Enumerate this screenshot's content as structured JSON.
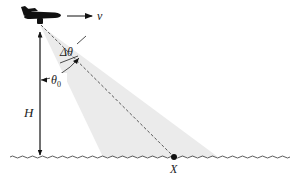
{
  "diagram": {
    "title": "",
    "labels": {
      "velocity": "v",
      "height": "H",
      "theta0": "θ",
      "theta0_sub": "0",
      "delta_theta": "Δθ",
      "target_point": "X"
    },
    "elements": [
      {
        "id": "airplane",
        "desc": "airplane silhouette moving right"
      },
      {
        "id": "velocity-arrow",
        "desc": "arrow pointing right labeled v"
      },
      {
        "id": "beam",
        "desc": "light-gray triangular beam from airplane to ground"
      },
      {
        "id": "line-of-sight",
        "desc": "dashed line from airplane to point X"
      },
      {
        "id": "height-arrow",
        "desc": "vertical arrow labeled H from airplane to ground"
      },
      {
        "id": "theta0-arc",
        "desc": "angle between vertical and line of sight"
      },
      {
        "id": "delta-theta-arc",
        "desc": "beam width angle"
      },
      {
        "id": "ground",
        "desc": "wavy ground/sea surface line"
      },
      {
        "id": "point-x",
        "desc": "black dot on ground labeled X"
      }
    ],
    "colors": {
      "ink": "#111111",
      "beam_fill": "#e8e8e8",
      "background": "#ffffff"
    }
  }
}
